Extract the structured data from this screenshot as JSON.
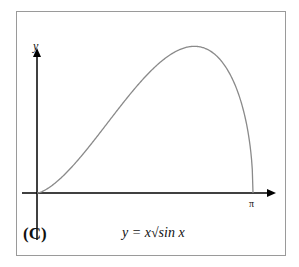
{
  "chart_data": {
    "type": "line",
    "title": "",
    "panel_label": "(C)",
    "formula": "y = x√sin x",
    "xlabel": "",
    "ylabel": "y",
    "x_ticks": [
      "π"
    ],
    "xlim": [
      0,
      3.1416
    ],
    "ylim": [
      0,
      1.85
    ],
    "grid": false,
    "series": [
      {
        "name": "y = x*sqrt(sin x)",
        "x": [
          0,
          0.25,
          0.5,
          0.75,
          1.0,
          1.25,
          1.5,
          1.75,
          2.0,
          2.2,
          2.4,
          2.6,
          2.8,
          3.0,
          3.1,
          3.1416
        ],
        "y": [
          0,
          0.124,
          0.346,
          0.621,
          0.917,
          1.216,
          1.497,
          1.726,
          1.907,
          1.953,
          1.934,
          1.917,
          1.625,
          1.126,
          0.631,
          0
        ]
      }
    ]
  },
  "colors": {
    "curve": "#8a8a8a",
    "axis": "#000000",
    "frame": "#9a9a9a"
  }
}
